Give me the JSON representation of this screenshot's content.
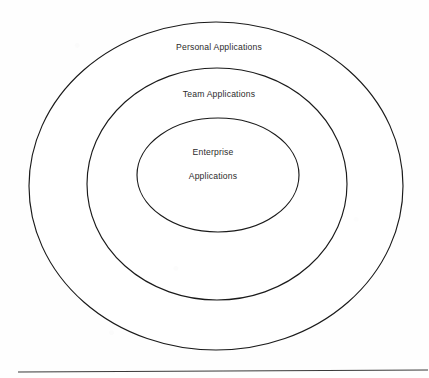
{
  "diagram": {
    "type": "concentric-ellipses",
    "background_color": "#fefefe",
    "stroke_color": "#1a1a1a",
    "text_color": "#2b2b2b",
    "rings": [
      {
        "id": "outer",
        "label": "Personal  Applications",
        "label_x": 219,
        "label_y": 50,
        "cx": 216,
        "cy": 186,
        "rx": 187,
        "ry": 164
      },
      {
        "id": "middle",
        "label": "Team Applications",
        "label_x": 219,
        "label_y": 97,
        "cx": 217,
        "cy": 184,
        "rx": 130,
        "ry": 116
      },
      {
        "id": "inner",
        "label": "Enterprise",
        "label_x": 213,
        "label_y": 155,
        "cx": 218,
        "cy": 175,
        "rx": 81,
        "ry": 57
      }
    ],
    "inner_label_line_two": {
      "label": "Applications",
      "label_x": 213,
      "label_y": 179
    },
    "baseline_rule": {
      "x1": 18,
      "y1": 372,
      "x2": 428,
      "y2": 370
    }
  }
}
